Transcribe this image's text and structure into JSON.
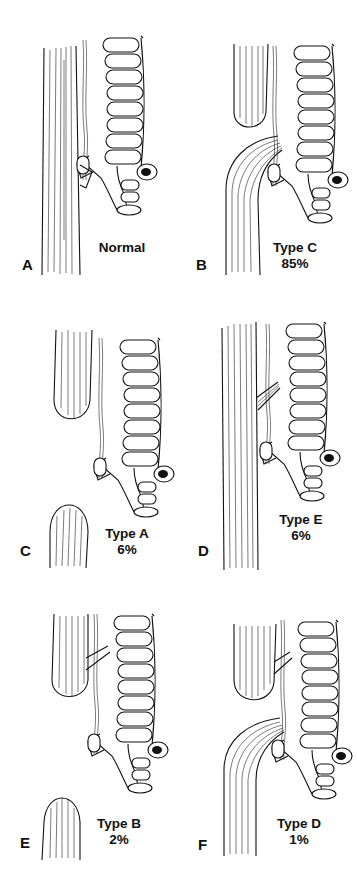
{
  "figure": {
    "panels": [
      {
        "letter": "A",
        "type_label": "Normal",
        "percent": ""
      },
      {
        "letter": "B",
        "type_label": "Type C",
        "percent": "85%"
      },
      {
        "letter": "C",
        "type_label": "Type A",
        "percent": "6%"
      },
      {
        "letter": "D",
        "type_label": "Type E",
        "percent": "6%"
      },
      {
        "letter": "E",
        "type_label": "Type B",
        "percent": "2%"
      },
      {
        "letter": "F",
        "type_label": "Type D",
        "percent": "1%"
      }
    ]
  }
}
